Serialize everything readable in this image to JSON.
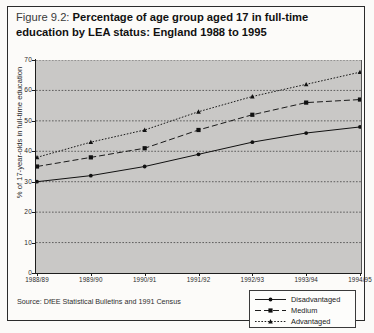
{
  "figure": {
    "number": "Figure 9.2:",
    "caption_line1": "Percentage of age group aged 17 in full-time",
    "caption_line2": "education by LEA status: England 1988 to 1995"
  },
  "source_note": "Source: DfEE Statistical Bulletins and 1991 Census",
  "legend": {
    "items": [
      {
        "label": "Disadvantaged",
        "style": "solid",
        "marker": "circle-marker",
        "color": "#111111"
      },
      {
        "label": "Medium",
        "style": "dashed",
        "marker": "square-marker",
        "color": "#111111"
      },
      {
        "label": "Advantaged",
        "style": "dotted",
        "marker": "triangle-marker",
        "color": "#111111"
      }
    ]
  },
  "chart_data": {
    "type": "line",
    "title": "Percentage of age group aged 17 in full-time education by LEA status: England 1988 to 1995",
    "xlabel": "",
    "ylabel": "% of 17-year-olds in full-time education",
    "categories": [
      "1988/89",
      "1989/90",
      "1990/91",
      "1991/92",
      "1992/93",
      "1993/94",
      "1994/95"
    ],
    "yticks": [
      0,
      10,
      20,
      30,
      40,
      50,
      60,
      70
    ],
    "ylim": [
      0,
      70
    ],
    "grid": true,
    "legend_position": "bottom-right",
    "plot_background": "#c9c8c6",
    "series": [
      {
        "name": "Disadvantaged",
        "values": [
          30,
          32,
          35,
          39,
          43,
          46,
          48
        ],
        "style": "solid",
        "marker": "circle"
      },
      {
        "name": "Medium",
        "values": [
          35,
          38,
          41,
          47,
          52,
          56,
          57
        ],
        "style": "dashed",
        "marker": "square"
      },
      {
        "name": "Advantaged",
        "values": [
          38,
          43,
          47,
          53,
          58,
          62,
          66
        ],
        "style": "dotted",
        "marker": "triangle"
      }
    ]
  }
}
